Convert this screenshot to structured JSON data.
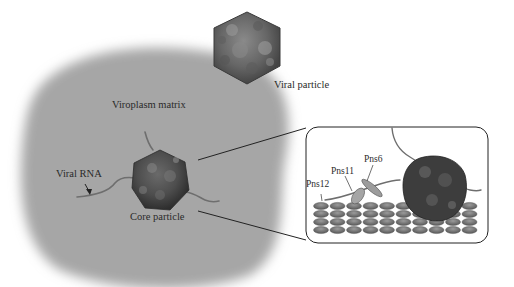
{
  "figure": {
    "type": "schematic",
    "color_mode": "grayscale"
  },
  "labels": {
    "viral_particle": "Viral particle",
    "viroplasm_matrix": "Viroplasm matrix",
    "viral_rna": "Viral RNA",
    "core_particle": "Core particle"
  },
  "inset": {
    "labels": {
      "pns6": "Pns6",
      "pns11": "Pns11",
      "pns12": "Pns12"
    },
    "lattice": {
      "rows": 4,
      "cols": 10
    }
  },
  "colors": {
    "background": "#ffffff",
    "matrix": "#a9a9a9",
    "particle_dark": "#4a4a4a",
    "particle_mid": "#7a7a7a",
    "particle_light": "#9a9a9a",
    "rna": "#6e6e6e",
    "lattice": "#7c7c7c",
    "outline": "#222222"
  }
}
